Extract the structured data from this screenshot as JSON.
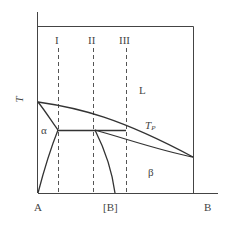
{
  "diagram": {
    "type": "binary phase diagram",
    "y_axis_label": "T",
    "x_axis_labels": {
      "left": "A",
      "middle": "[B]",
      "right": "B"
    },
    "composition_lines": [
      "I",
      "II",
      "III"
    ],
    "regions": {
      "liquid": "L",
      "alpha": "α",
      "beta": "β"
    },
    "peritectic_label": {
      "main": "T",
      "sub": "P"
    },
    "colors": {
      "line": "#333333",
      "dashed": "#555555",
      "background": "#ffffff"
    }
  }
}
